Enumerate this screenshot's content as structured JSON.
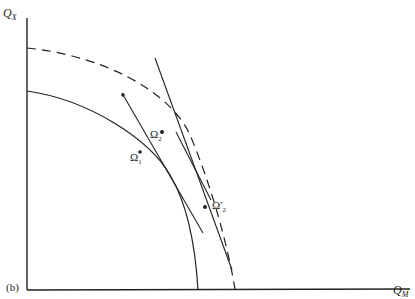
{
  "figure": {
    "panel_label": "(b)",
    "y_axis": {
      "base": "Q",
      "sub": "X"
    },
    "x_axis": {
      "base": "Q",
      "sub": "M"
    },
    "curves": [
      {
        "name": "inner production frontier",
        "style": "solid"
      },
      {
        "name": "outer production frontier",
        "style": "dashed"
      }
    ],
    "points": [
      {
        "label": "Ω",
        "sub": "1",
        "prime": ""
      },
      {
        "label": "Ω",
        "sub": "2",
        "prime": ""
      },
      {
        "label": "Ω",
        "sub": "2",
        "prime": "′"
      }
    ],
    "colors": {
      "ink": "#222222",
      "background": "#ffffff"
    }
  }
}
